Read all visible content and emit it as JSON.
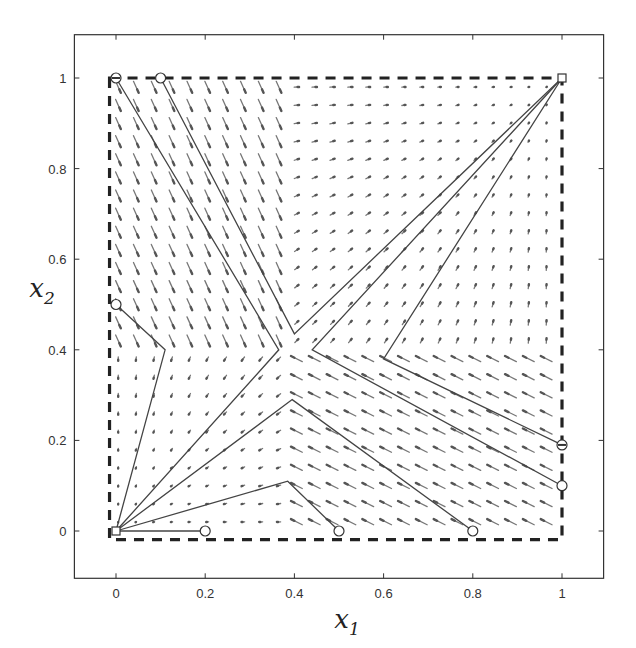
{
  "chart_data": {
    "type": "vector-field",
    "title": "",
    "xlabel": "x",
    "xlabel_subscript": "1",
    "ylabel": "x",
    "ylabel_subscript": "2",
    "xlim": [
      -0.1,
      1.1
    ],
    "ylim": [
      -0.1,
      1.1
    ],
    "xticks": [
      0,
      0.2,
      0.4,
      0.6,
      0.8,
      1
    ],
    "xtick_labels": [
      "0",
      "0.2",
      "0.4",
      "0.6",
      "0.8",
      "1"
    ],
    "yticks": [
      0,
      0.2,
      0.4,
      0.6,
      0.8,
      1
    ],
    "ytick_labels": [
      "0",
      "0.2",
      "0.4",
      "0.6",
      "0.8",
      "1"
    ],
    "grid": false,
    "legend": "none",
    "domain_box": {
      "x": [
        -0.01,
        1.0
      ],
      "y": [
        -0.01,
        1.0
      ],
      "style": "dashed"
    },
    "field": {
      "grid_step": 0.04,
      "switch_point": [
        0.4,
        0.4
      ],
      "regions": [
        {
          "name": "upper-left",
          "x": [
            0,
            0.4
          ],
          "y": [
            0.4,
            1
          ],
          "direction": [
            0.45,
            -1.0
          ],
          "magnitude": 0.9
        },
        {
          "name": "upper-right",
          "x": [
            0.4,
            1
          ],
          "y": [
            0.4,
            1
          ],
          "attractor": [
            1,
            1
          ],
          "magnitude": 0.35
        },
        {
          "name": "lower-left",
          "x": [
            0,
            0.4
          ],
          "y": [
            0,
            0.4
          ],
          "attractor": [
            0,
            0
          ],
          "magnitude": 0.35
        },
        {
          "name": "lower-right",
          "x": [
            0.4,
            1
          ],
          "y": [
            0,
            0.4
          ],
          "direction": [
            -1.0,
            0.5
          ],
          "magnitude": 0.9
        }
      ]
    },
    "trajectories": [
      {
        "start": [
          0.0,
          1.0
        ],
        "points": [
          [
            0.0,
            1.0
          ],
          [
            0.365,
            0.4
          ],
          [
            0.0,
            0.0
          ]
        ],
        "start_marker": "circle-filled",
        "end": [
          0,
          0
        ]
      },
      {
        "start": [
          0.1,
          1.0
        ],
        "points": [
          [
            0.1,
            1.0
          ],
          [
            0.4,
            0.435
          ],
          [
            1.0,
            1.0
          ]
        ],
        "start_marker": "circle",
        "end": [
          1,
          1
        ]
      },
      {
        "start": [
          0.0,
          0.5
        ],
        "points": [
          [
            0.0,
            0.5
          ],
          [
            0.11,
            0.4
          ],
          [
            0.0,
            0.0
          ]
        ],
        "start_marker": "circle",
        "end": [
          0,
          0
        ]
      },
      {
        "start": [
          0.2,
          0.0
        ],
        "points": [
          [
            0.2,
            0.0
          ],
          [
            0.0,
            0.0
          ]
        ],
        "start_marker": "circle",
        "end": [
          0,
          0
        ]
      },
      {
        "start": [
          0.5,
          0.0
        ],
        "points": [
          [
            0.5,
            0.0
          ],
          [
            0.385,
            0.11
          ],
          [
            0.0,
            0.0
          ]
        ],
        "start_marker": "circle",
        "end": [
          0,
          0
        ]
      },
      {
        "start": [
          0.8,
          0.0
        ],
        "points": [
          [
            0.8,
            0.0
          ],
          [
            0.395,
            0.29
          ],
          [
            0.0,
            0.0
          ]
        ],
        "start_marker": "circle",
        "end": [
          0,
          0
        ]
      },
      {
        "start": [
          1.0,
          0.1
        ],
        "points": [
          [
            1.0,
            0.1
          ],
          [
            0.44,
            0.4
          ],
          [
            1.0,
            1.0
          ]
        ],
        "start_marker": "circle",
        "end": [
          1,
          1
        ]
      },
      {
        "start": [
          1.0,
          0.19
        ],
        "points": [
          [
            1.0,
            0.19
          ],
          [
            0.6,
            0.38
          ],
          [
            1.0,
            1.0
          ]
        ],
        "start_marker": "circle-filled",
        "end": [
          1,
          1
        ]
      }
    ],
    "equilibria": [
      {
        "point": [
          0,
          0
        ],
        "marker": "square"
      },
      {
        "point": [
          1,
          1
        ],
        "marker": "square"
      }
    ]
  }
}
